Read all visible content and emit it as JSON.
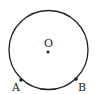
{
  "diagram": {
    "type": "geometry-circle",
    "circle": {
      "cx": 48.5,
      "cy": 50,
      "r": 39.5,
      "stroke": "#222222"
    },
    "center": {
      "label": "O",
      "x": 48,
      "y": 52
    },
    "points": [
      {
        "label": "A",
        "x": 21,
        "y": 80
      },
      {
        "label": "B",
        "x": 76,
        "y": 79
      }
    ]
  }
}
